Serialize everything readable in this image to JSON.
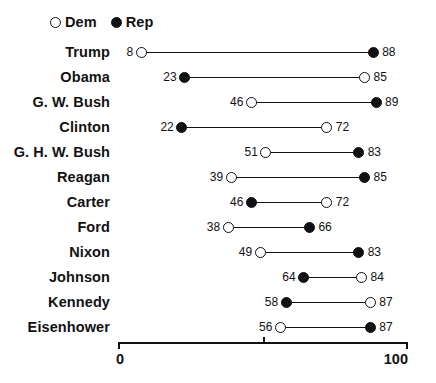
{
  "legend": {
    "entries": [
      {
        "label": "Dem",
        "marker": "open-circle-icon"
      },
      {
        "label": "Rep",
        "marker": "filled-circle-icon"
      }
    ]
  },
  "axis": {
    "min_label": "0",
    "max_label": "100",
    "mid_label": ""
  },
  "colors": {
    "ink": "#111111",
    "background": "#ffffff"
  },
  "chart_data": {
    "type": "dumbbell",
    "title": "",
    "subtitle": "",
    "xlabel": "",
    "ylabel": "",
    "xlim": [
      0,
      100
    ],
    "xticks": [
      0,
      50,
      100
    ],
    "xtick_labels": [
      "0",
      "",
      "100"
    ],
    "grid": false,
    "legend_position": "top-left",
    "categories": [
      "Trump",
      "Obama",
      "G. W. Bush",
      "Clinton",
      "G. H. W. Bush",
      "Reagan",
      "Carter",
      "Ford",
      "Nixon",
      "Johnson",
      "Kennedy",
      "Eisenhower"
    ],
    "series": [
      {
        "name": "Dem",
        "marker": "open-circle-icon",
        "values": [
          8,
          85,
          46,
          72,
          51,
          39,
          72,
          38,
          49,
          84,
          87,
          56
        ]
      },
      {
        "name": "Rep",
        "marker": "filled-circle-icon",
        "values": [
          88,
          23,
          89,
          22,
          83,
          85,
          46,
          66,
          83,
          64,
          58,
          87
        ]
      }
    ],
    "rows": [
      {
        "label": "Trump",
        "dem": 8,
        "rep": 88
      },
      {
        "label": "Obama",
        "dem": 85,
        "rep": 23
      },
      {
        "label": "G. W. Bush",
        "dem": 46,
        "rep": 89
      },
      {
        "label": "Clinton",
        "dem": 72,
        "rep": 22
      },
      {
        "label": "G. H. W. Bush",
        "dem": 51,
        "rep": 83
      },
      {
        "label": "Reagan",
        "dem": 39,
        "rep": 85
      },
      {
        "label": "Carter",
        "dem": 72,
        "rep": 46
      },
      {
        "label": "Ford",
        "dem": 38,
        "rep": 66
      },
      {
        "label": "Nixon",
        "dem": 49,
        "rep": 83
      },
      {
        "label": "Johnson",
        "dem": 84,
        "rep": 64
      },
      {
        "label": "Kennedy",
        "dem": 87,
        "rep": 58
      },
      {
        "label": "Eisenhower",
        "dem": 56,
        "rep": 87
      }
    ]
  }
}
